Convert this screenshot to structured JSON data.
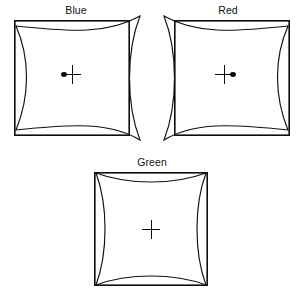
{
  "figure": {
    "background_color": "#ffffff",
    "line_color": "#111111",
    "panel_count": 3
  },
  "panels": {
    "blue": {
      "title": "Blue",
      "spike_side": "right",
      "dot_side": "left",
      "has_dot": true,
      "rect": {
        "x": 14,
        "y": 20,
        "width": 116,
        "height": 116
      },
      "spikes": [
        {
          "corner": "top-right",
          "x": 140,
          "y": 16
        },
        {
          "corner": "bottom-right",
          "x": 140,
          "y": 140
        }
      ],
      "cross": {
        "cx": 72,
        "cy": 74,
        "half": 9
      },
      "dot": {
        "cx": 64,
        "cy": 74,
        "rx": 2.6,
        "ry": 2.2
      }
    },
    "red": {
      "title": "Red",
      "spike_side": "left",
      "dot_side": "right",
      "has_dot": true,
      "rect": {
        "x": 22,
        "y": 20,
        "width": 116,
        "height": 116
      },
      "spikes": [
        {
          "corner": "top-left",
          "x": 12,
          "y": 16
        },
        {
          "corner": "bottom-left",
          "x": 12,
          "y": 140
        }
      ],
      "cross": {
        "cx": 72,
        "cy": 74,
        "half": 9
      },
      "dot": {
        "cx": 80,
        "cy": 74,
        "rx": 2.6,
        "ry": 2.2
      }
    },
    "green": {
      "title": "Green",
      "spike_side": "none",
      "dot_side": "none",
      "has_dot": false,
      "rect": {
        "x": 18,
        "y": 20,
        "width": 114,
        "height": 113
      },
      "spikes": [],
      "cross": {
        "cx": 75,
        "cy": 77,
        "half": 9
      },
      "dot": null
    }
  },
  "markers": {
    "cross_label": "center-cross-marker",
    "dot_label": "offset-dot-marker"
  }
}
